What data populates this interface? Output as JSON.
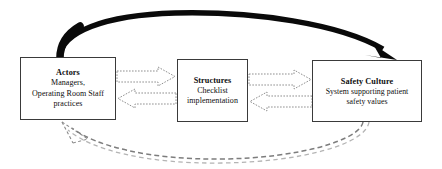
{
  "figure": {
    "type": "cyclic-process-diagram",
    "background_color": "#ffffff",
    "nodes": [
      {
        "id": "actors",
        "title": "Actors",
        "description_line_1": "Managers,",
        "description_line_2": "Operating Room Staff",
        "description_line_3": "practices",
        "border_color": "#3a3a3a",
        "fill_color": "#ffffff"
      },
      {
        "id": "structures",
        "title": "Structures",
        "description_line_1": "Checklist",
        "description_line_2": "implementation",
        "description_line_3": "",
        "border_color": "#3a3a3a",
        "fill_color": "#ffffff"
      },
      {
        "id": "safety_culture",
        "title": "Safety Culture",
        "description_line_1": "System supporting patient",
        "description_line_2": "safety values",
        "description_line_3": "",
        "border_color": "#3a3a3a",
        "fill_color": "#ffffff"
      }
    ],
    "connectors": [
      {
        "id": "actors-to-structures",
        "style": "hollow-block-arrow-dotted-outline",
        "direction": "right",
        "from": "actors",
        "to": "structures",
        "color": "#8a8a8a"
      },
      {
        "id": "structures-to-actors",
        "style": "hollow-block-arrow-dotted-outline",
        "direction": "left",
        "from": "structures",
        "to": "actors",
        "color": "#8a8a8a"
      },
      {
        "id": "structures-to-safety",
        "style": "hollow-block-arrow-dotted-outline",
        "direction": "right",
        "from": "structures",
        "to": "safety_culture",
        "color": "#8a8a8a"
      },
      {
        "id": "safety-to-structures",
        "style": "hollow-block-arrow-dotted-outline",
        "direction": "left",
        "from": "safety_culture",
        "to": "structures",
        "color": "#8a8a8a"
      },
      {
        "id": "actors-to-safety-top",
        "style": "thick-solid-curved-arrow",
        "direction": "clockwise-over-top",
        "from": "actors",
        "to": "safety_culture",
        "color": "#000000"
      },
      {
        "id": "safety-to-actors-bottom",
        "style": "thin-dashed-curved-arrow",
        "direction": "counterclockwise-under-bottom",
        "from": "safety_culture",
        "to": "actors",
        "color": "#6e6e6e"
      }
    ]
  }
}
